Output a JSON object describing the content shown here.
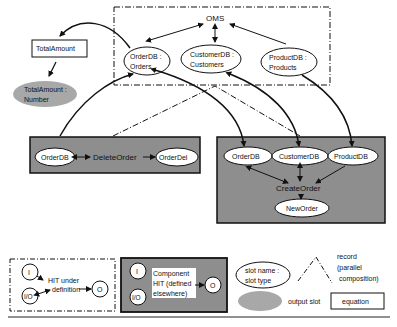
{
  "oms": {
    "title": "OMS",
    "slots": [
      {
        "line1": "OrderDB :",
        "line2": "Orders"
      },
      {
        "line1": "CustomerDB :",
        "line2": "Customers"
      },
      {
        "line1": "ProductDB :",
        "line2": "Products"
      }
    ]
  },
  "total_amount": {
    "equation_label": "TotalAmount",
    "output_line1": "TotalAmount :",
    "output_line2": "Number"
  },
  "delete_order": {
    "title": "DeleteOrder",
    "input_slot": "OrderDB",
    "output_slot": "OrderDel"
  },
  "create_order": {
    "title": "CreateOrder",
    "input_slots": [
      "OrderDB",
      "CustomerDB",
      "ProductDB"
    ],
    "output_slot": "NewOrder"
  },
  "legend": {
    "hit_under_definition": {
      "in_slot": "I",
      "io_slot": "I/O",
      "out_slot": "O",
      "line1": "HIT under",
      "line2": "definition"
    },
    "component_hit": {
      "in_slot": "I",
      "io_slot": "I/O",
      "out_slot": "O",
      "line1": "Component",
      "line2": "HIT (defined",
      "line3": "elsewhere)"
    },
    "slot": {
      "line1": "slot name :",
      "line2": "slot type"
    },
    "record": {
      "line1": "record",
      "line2": "(parallel",
      "line3": "composition)"
    },
    "output_slot": "output slot",
    "equation": "equation"
  },
  "colors": {
    "hit_fill": "#8e8e8e",
    "output_slot_fill": "#a8a8a8",
    "stroke": "#111111",
    "background": "#ffffff"
  }
}
